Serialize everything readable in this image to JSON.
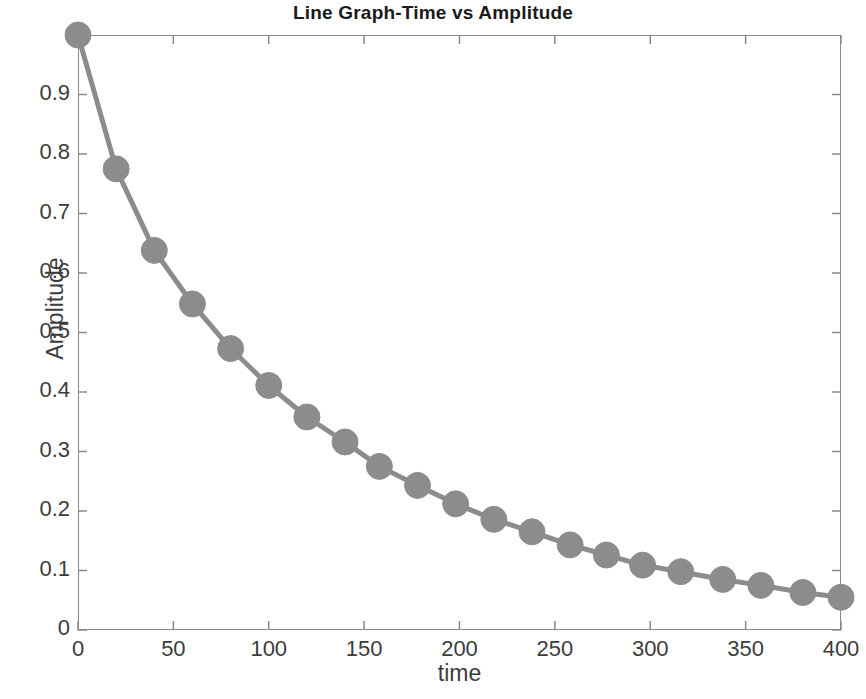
{
  "chart_data": {
    "type": "line",
    "title": "Line Graph-Time vs Amplitude",
    "xlabel": "time",
    "ylabel": "Amplitude",
    "xlim": [
      0,
      400
    ],
    "ylim": [
      0,
      1
    ],
    "xticks": [
      0,
      50,
      100,
      150,
      200,
      250,
      300,
      350,
      400
    ],
    "xtick_labels": [
      "0",
      "50",
      "100",
      "150",
      "200",
      "250",
      "300",
      "350",
      "400"
    ],
    "yticks": [
      0,
      0.1,
      0.2,
      0.3,
      0.4,
      0.5,
      0.6,
      0.7,
      0.8,
      0.9
    ],
    "ytick_labels": [
      "0",
      "0.1",
      "0.2",
      "0.3",
      "0.4",
      "0.5",
      "0.6",
      "0.7",
      "0.8",
      "0.9"
    ],
    "grid": false,
    "legend": null,
    "marker": "circle",
    "marker_size": 26,
    "line_width": 5,
    "series_color": "#8c8c8c",
    "axis_color": "#8a8a8a",
    "text_color": "#3c3c3c",
    "background": "#ffffff",
    "tick_direction": "in",
    "box": true,
    "series": [
      {
        "name": "Amplitude",
        "x": [
          0,
          20,
          40,
          60,
          80,
          100,
          120,
          140,
          158,
          178,
          198,
          218,
          238,
          258,
          277,
          296,
          316,
          338,
          358,
          380,
          400
        ],
        "y": [
          1.0,
          0.775,
          0.638,
          0.548,
          0.473,
          0.411,
          0.358,
          0.316,
          0.275,
          0.243,
          0.212,
          0.186,
          0.165,
          0.143,
          0.126,
          0.109,
          0.098,
          0.085,
          0.075,
          0.063,
          0.055
        ]
      }
    ]
  }
}
